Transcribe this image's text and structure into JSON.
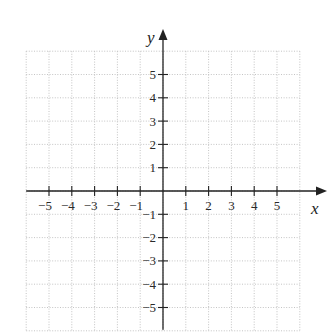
{
  "chart_data": {
    "type": "scatter",
    "title": "",
    "xlabel": "x",
    "ylabel": "y",
    "xlim": [
      -6,
      6
    ],
    "ylim": [
      -6,
      6
    ],
    "grid": true,
    "grid_style": "dotted",
    "x_ticks": [
      -5,
      -4,
      -3,
      -2,
      -1,
      1,
      2,
      3,
      4,
      5
    ],
    "y_ticks": [
      -5,
      -4,
      -3,
      -2,
      -1,
      1,
      2,
      3,
      4,
      5
    ],
    "x_tick_labels": [
      "−5",
      "−4",
      "−3",
      "−2",
      "−1",
      "1",
      "2",
      "3",
      "4",
      "5"
    ],
    "y_tick_labels": [
      "−5",
      "−4",
      "−3",
      "−2",
      "−1",
      "1",
      "2",
      "3",
      "4",
      "5"
    ],
    "series": [],
    "legend": null
  },
  "colors": {
    "axis": "#222222",
    "grid": "#bdbdbd",
    "background": "#ffffff"
  },
  "layout": {
    "origin_px": [
      163,
      191
    ],
    "unit_x_px": 22.8,
    "unit_y_px": 23.3
  }
}
